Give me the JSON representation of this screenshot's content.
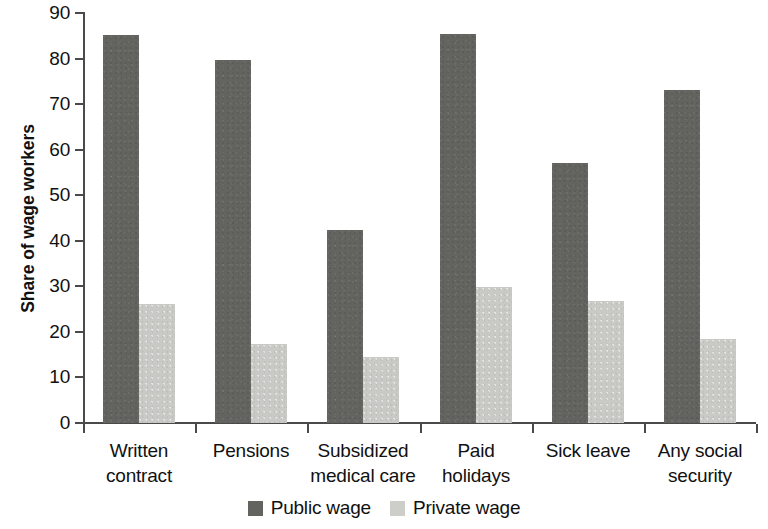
{
  "chart_data": {
    "type": "bar",
    "title": "",
    "xlabel": "",
    "ylabel": "Share of wage workers",
    "ylim": [
      0,
      90
    ],
    "ytick_labels": [
      "90",
      "80",
      "70",
      "60",
      "50",
      "40",
      "30",
      "20",
      "10",
      "0"
    ],
    "yticks": [
      90,
      80,
      70,
      60,
      50,
      40,
      30,
      20,
      10,
      0
    ],
    "grid": false,
    "legend_position": "bottom-center",
    "categories": [
      "Written contract",
      "Pensions",
      "Subsidized medical care",
      "Paid holidays",
      "Sick leave",
      "Any social security"
    ],
    "category_lines": [
      [
        "Written",
        "contract"
      ],
      [
        "Pensions",
        ""
      ],
      [
        "Subsidized",
        "medical care"
      ],
      [
        "Paid",
        "holidays"
      ],
      [
        "Sick leave",
        ""
      ],
      [
        "Any social",
        "security"
      ]
    ],
    "series": [
      {
        "name": "Public wage",
        "color": "#636360",
        "values": [
          85.2,
          79.6,
          42.3,
          85.4,
          57.0,
          73.2
        ]
      },
      {
        "name": "Private wage",
        "color": "#c9c9c6",
        "values": [
          26.2,
          17.3,
          14.5,
          29.9,
          26.8,
          18.4
        ]
      }
    ]
  },
  "legend": {
    "items": [
      {
        "label": "Public wage",
        "swatch": "public"
      },
      {
        "label": "Private wage",
        "swatch": "private"
      }
    ]
  }
}
